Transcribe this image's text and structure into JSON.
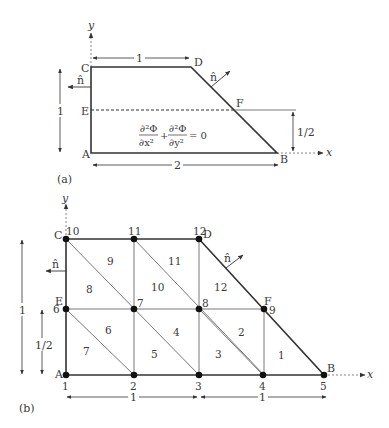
{
  "figure_a": {
    "label": "(a)",
    "axis_x": "x",
    "axis_y": "y",
    "points": {
      "A": "A",
      "B": "B",
      "C": "C",
      "D": "D",
      "E": "E",
      "F": "F"
    },
    "normal": "n̂",
    "dim_top": "1",
    "dim_left": "1",
    "dim_bottom": "2",
    "dim_right": "1/2",
    "equation": {
      "term1_num": "∂²Φ",
      "term1_den": "∂x²",
      "plus": "+",
      "term2_num": "∂²Φ",
      "term2_den": "∂y²",
      "rhs": "= 0"
    }
  },
  "figure_b": {
    "label": "(b)",
    "axis_x": "x",
    "axis_y": "y",
    "points": {
      "A": "A",
      "B": "B",
      "C": "C",
      "D": "D",
      "E": "E",
      "F": "F"
    },
    "normal": "n̂",
    "dim_left": "1",
    "dim_left_half": "1/2",
    "dim_bottom_left": "1",
    "dim_bottom_right": "1",
    "nodes": [
      {
        "id": "1",
        "x": 0,
        "y": 0
      },
      {
        "id": "2",
        "x": 0.5,
        "y": 0
      },
      {
        "id": "3",
        "x": 1,
        "y": 0
      },
      {
        "id": "4",
        "x": 1.5,
        "y": 0
      },
      {
        "id": "5",
        "x": 2,
        "y": 0
      },
      {
        "id": "6",
        "x": 0,
        "y": 0.5
      },
      {
        "id": "7",
        "x": 0.5,
        "y": 0.5
      },
      {
        "id": "8",
        "x": 1,
        "y": 0.5
      },
      {
        "id": "9",
        "x": 1.5,
        "y": 0.5
      },
      {
        "id": "10",
        "x": 0,
        "y": 1
      },
      {
        "id": "11",
        "x": 0.5,
        "y": 1
      },
      {
        "id": "12",
        "x": 1,
        "y": 1
      }
    ],
    "elements": [
      "1",
      "2",
      "3",
      "4",
      "5",
      "6",
      "7",
      "8",
      "9",
      "10",
      "11",
      "12"
    ]
  }
}
